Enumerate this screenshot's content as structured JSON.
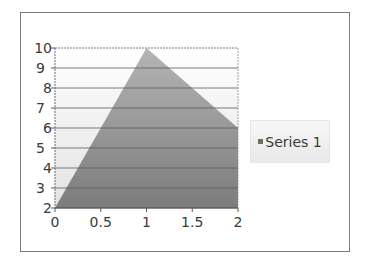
{
  "chart_data": {
    "type": "area",
    "title": "",
    "xlabel": "",
    "ylabel": "",
    "x": [
      0,
      1,
      2
    ],
    "series": [
      {
        "name": "Series 1",
        "values": [
          2,
          10,
          6
        ],
        "color": "#808080"
      }
    ],
    "x_ticks": [
      "0",
      "0.5",
      "1",
      "1.5",
      "2"
    ],
    "y_ticks": [
      "2",
      "3",
      "4",
      "5",
      "6",
      "7",
      "8",
      "9",
      "10"
    ],
    "xlim": [
      0,
      2
    ],
    "ylim": [
      2,
      10
    ],
    "grid": {
      "horizontal": true,
      "vertical": false
    },
    "legend_position": "right"
  },
  "legend": {
    "items": [
      {
        "label": "Series 1"
      }
    ]
  }
}
